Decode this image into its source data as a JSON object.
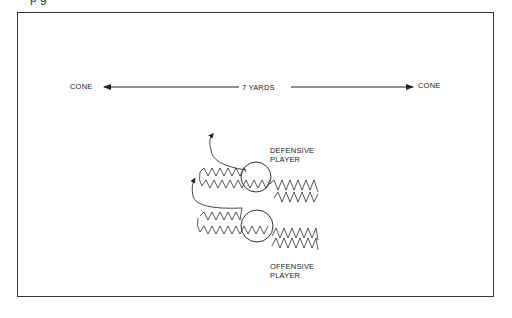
{
  "page": {
    "caption_partial": "p          g"
  },
  "diagram": {
    "left_cone_label": "CONE",
    "right_cone_label": "CONE",
    "distance_label": "7 YARDS",
    "defensive_label_line1": "DEFENSIVE",
    "defensive_label_line2": "PLAYER",
    "offensive_label_line1": "OFFENSIVE",
    "offensive_label_line2": "PLAYER",
    "stroke_color": "#333333"
  }
}
